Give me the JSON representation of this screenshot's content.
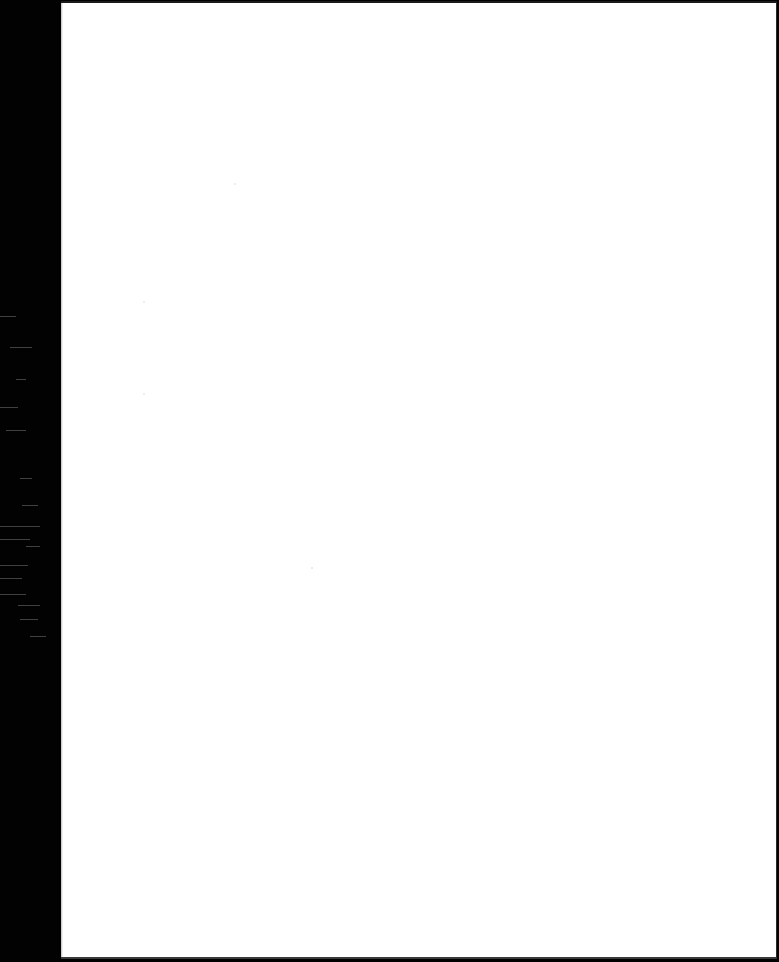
{
  "document": {
    "type": "scanned-page",
    "content": "",
    "colors": {
      "page": "#ffffff",
      "scanner_margin": "#000000",
      "border": "#1a1a1a"
    }
  }
}
